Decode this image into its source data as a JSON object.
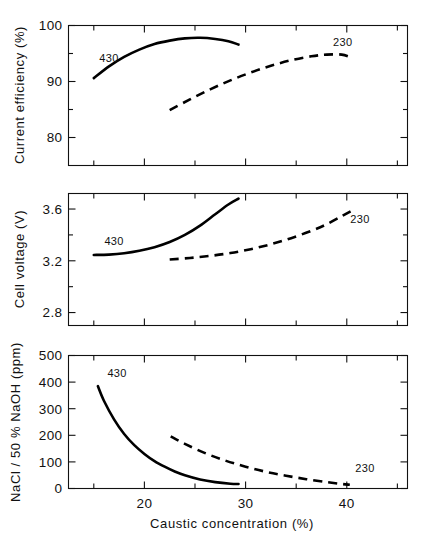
{
  "figure": {
    "title": "",
    "background": "#ffffff",
    "line_color": "#000000",
    "axis_color": "#111111",
    "width": 424,
    "height": 545
  },
  "xaxis": {
    "label": "Caustic concentration (%)",
    "min": 12.5,
    "max": 46,
    "major_ticks": [
      20,
      30,
      40
    ],
    "major_tick_labels": [
      "20",
      "30",
      "40"
    ],
    "minor_ticks": [
      15,
      25,
      35,
      45
    ]
  },
  "series_labels": {
    "solid": "430",
    "dashed": "230"
  },
  "chart_data": [
    {
      "type": "line",
      "panel": 1,
      "title": "",
      "xlabel": "Caustic concentration (%)",
      "ylabel": "Current efficiency (%)",
      "xlim": [
        12.5,
        46
      ],
      "ylim": [
        75,
        100
      ],
      "yticks": [
        80,
        90,
        100
      ],
      "ytick_labels": [
        "80",
        "90",
        "100"
      ],
      "y_minor_ticks": [
        85,
        95
      ],
      "grid": false,
      "legend": "inline-annotations",
      "series": [
        {
          "name": "430",
          "style": "solid",
          "annotation": "430",
          "annotation_x": 16.5,
          "annotation_y": 93.4,
          "x": [
            15.0,
            16.5,
            18.0,
            19.5,
            21.0,
            22.5,
            24.0,
            25.5,
            27.0,
            28.3,
            29.3
          ],
          "y": [
            90.6,
            92.7,
            94.4,
            95.7,
            96.7,
            97.3,
            97.7,
            97.8,
            97.6,
            97.2,
            96.6
          ]
        },
        {
          "name": "230",
          "style": "dashed",
          "annotation": "230",
          "annotation_x": 39.6,
          "annotation_y": 96.4,
          "x": [
            22.5,
            24.5,
            26.5,
            28.5,
            30.5,
            32.5,
            34.5,
            36.5,
            38.0,
            39.5,
            40.6
          ],
          "y": [
            84.9,
            86.8,
            88.6,
            90.2,
            91.6,
            92.8,
            93.8,
            94.5,
            94.8,
            94.8,
            94.2
          ]
        }
      ]
    },
    {
      "type": "line",
      "panel": 2,
      "title": "",
      "xlabel": "Caustic concentration (%)",
      "ylabel": "Cell voltage (V)",
      "xlim": [
        12.5,
        46
      ],
      "ylim": [
        2.7,
        3.72
      ],
      "yticks": [
        2.8,
        3.2,
        3.6
      ],
      "ytick_labels": [
        "2.8",
        "3.2",
        "3.6"
      ],
      "y_minor_ticks": [
        3.0,
        3.4
      ],
      "grid": false,
      "legend": "inline-annotations",
      "series": [
        {
          "name": "430",
          "style": "solid",
          "annotation": "430",
          "annotation_x": 17.0,
          "annotation_y": 3.32,
          "x": [
            15.0,
            16.5,
            18.0,
            19.5,
            21.0,
            22.5,
            24.0,
            25.5,
            27.0,
            28.3,
            29.3
          ],
          "y": [
            3.245,
            3.248,
            3.258,
            3.277,
            3.305,
            3.345,
            3.4,
            3.472,
            3.56,
            3.635,
            3.68
          ]
        },
        {
          "name": "230",
          "style": "dashed",
          "annotation": "230",
          "annotation_x": 41.3,
          "annotation_y": 3.49,
          "x": [
            22.5,
            24.5,
            26.5,
            28.5,
            30.5,
            32.5,
            34.5,
            36.5,
            38.0,
            39.5,
            40.6
          ],
          "y": [
            3.21,
            3.222,
            3.238,
            3.26,
            3.29,
            3.328,
            3.375,
            3.432,
            3.482,
            3.545,
            3.592
          ]
        }
      ]
    },
    {
      "type": "line",
      "panel": 3,
      "title": "",
      "xlabel": "Caustic concentration (%)",
      "ylabel": "NaCl / 50 % NaOH (ppm)",
      "xlim": [
        12.5,
        46
      ],
      "ylim": [
        0,
        500
      ],
      "yticks": [
        0,
        100,
        200,
        300,
        400,
        500
      ],
      "ytick_labels": [
        "0",
        "100",
        "200",
        "300",
        "400",
        "500"
      ],
      "y_minor_ticks": [],
      "grid": false,
      "legend": "inline-annotations",
      "series": [
        {
          "name": "430",
          "style": "solid",
          "annotation": "430",
          "annotation_x": 17.3,
          "annotation_y": 420,
          "x": [
            15.4,
            16.0,
            17.0,
            18.0,
            19.0,
            20.0,
            21.0,
            22.0,
            23.0,
            24.0,
            25.5,
            27.0,
            28.5,
            29.3
          ],
          "y": [
            385,
            330,
            260,
            205,
            163,
            130,
            103,
            82,
            64,
            50,
            34,
            24,
            18,
            17
          ]
        },
        {
          "name": "230",
          "style": "dashed",
          "annotation": "230",
          "annotation_x": 41.8,
          "annotation_y": 62,
          "x": [
            22.6,
            24.0,
            26.0,
            28.0,
            30.0,
            32.0,
            34.0,
            36.0,
            38.0,
            39.5,
            40.3
          ],
          "y": [
            196,
            168,
            133,
            105,
            82,
            63,
            48,
            35,
            24,
            17,
            14
          ]
        }
      ]
    }
  ]
}
